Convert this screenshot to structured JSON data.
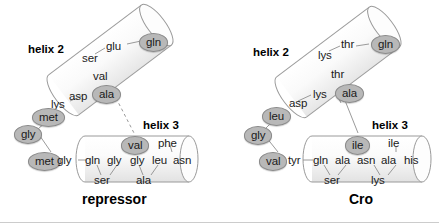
{
  "figure": {
    "type": "molecular-diagram"
  },
  "panels": [
    {
      "id": "repressor",
      "title": "repressor",
      "helix2_label": "helix 2",
      "helix3_label": "helix 3",
      "helix2_residues": [
        {
          "text": "gln",
          "highlight": true
        },
        {
          "text": "glu",
          "highlight": false
        },
        {
          "text": "ser",
          "highlight": false
        },
        {
          "text": "val",
          "highlight": false
        },
        {
          "text": "ala",
          "highlight": true
        },
        {
          "text": "asp",
          "highlight": false
        },
        {
          "text": "lys",
          "highlight": false
        }
      ],
      "loop_residues": [
        {
          "text": "met",
          "highlight": true
        },
        {
          "text": "gly",
          "highlight": true
        },
        {
          "text": "met",
          "highlight": true
        },
        {
          "text": "gly",
          "highlight": false
        }
      ],
      "helix3_residues": [
        {
          "text": "gln",
          "highlight": false
        },
        {
          "text": "gly",
          "highlight": false
        },
        {
          "text": "ser",
          "highlight": false
        },
        {
          "text": "val",
          "highlight": true
        },
        {
          "text": "gly",
          "highlight": false
        },
        {
          "text": "ala",
          "highlight": false
        },
        {
          "text": "phe",
          "highlight": false
        },
        {
          "text": "leu",
          "highlight": false
        },
        {
          "text": "asn",
          "highlight": false
        }
      ]
    },
    {
      "id": "cro",
      "title": "Cro",
      "helix2_label": "helix 2",
      "helix3_label": "helix 3",
      "helix2_residues": [
        {
          "text": "gln",
          "highlight": true
        },
        {
          "text": "thr",
          "highlight": false
        },
        {
          "text": "lys",
          "highlight": false
        },
        {
          "text": "thr",
          "highlight": false
        },
        {
          "text": "ala",
          "highlight": true
        },
        {
          "text": "lys",
          "highlight": false
        },
        {
          "text": "asp",
          "highlight": false
        }
      ],
      "loop_residues": [
        {
          "text": "leu",
          "highlight": true
        },
        {
          "text": "gly",
          "highlight": true
        },
        {
          "text": "val",
          "highlight": true
        },
        {
          "text": "tyr",
          "highlight": false
        }
      ],
      "helix3_residues": [
        {
          "text": "gln",
          "highlight": false
        },
        {
          "text": "ala",
          "highlight": false
        },
        {
          "text": "ser",
          "highlight": false
        },
        {
          "text": "ile",
          "highlight": true
        },
        {
          "text": "asn",
          "highlight": false
        },
        {
          "text": "ala",
          "highlight": false
        },
        {
          "text": "lys",
          "highlight": false
        },
        {
          "text": "ile",
          "highlight": false
        },
        {
          "text": "his",
          "highlight": false
        }
      ]
    }
  ],
  "colors": {
    "background": "#ffffff",
    "cylinder_stroke": "#9a9a9a",
    "cylinder_fill": "#f7f7f7",
    "highlight_fill": "#b8b8b8",
    "text": "#1a1a1a",
    "connector": "#8f8f8f"
  },
  "labels": {
    "repressor_h2": "helix 2",
    "repressor_h3": "helix 3",
    "repressor_title": "repressor",
    "cro_h2": "helix 2",
    "cro_h3": "helix 3",
    "cro_title": "Cro"
  }
}
